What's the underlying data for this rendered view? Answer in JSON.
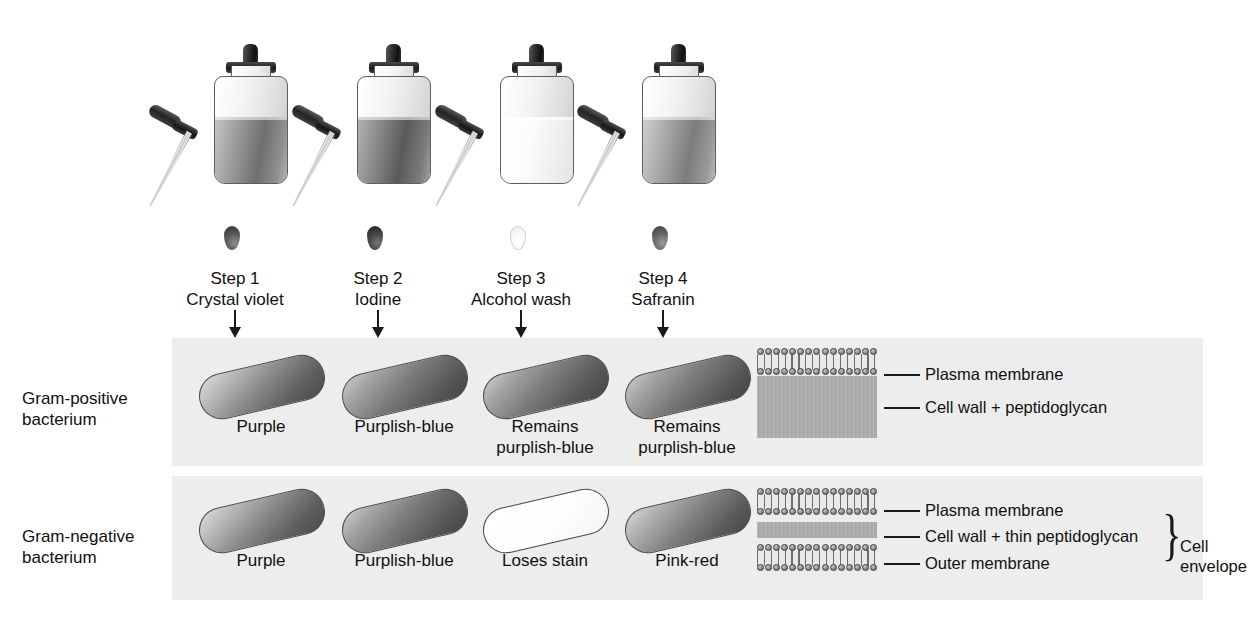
{
  "figure": {
    "background_color": "#ffffff",
    "band_color": "#ededed",
    "peptidoglycan_color": "#a9a9a9",
    "ink_color": "#111111"
  },
  "steps": [
    {
      "index": 1,
      "step_label": "Step 1",
      "reagent": "Crystal violet",
      "bottle_fill": "dark",
      "droplet_fill": "dark",
      "left": 140
    },
    {
      "index": 2,
      "step_label": "Step 2",
      "reagent": "Iodine",
      "bottle_fill": "darker",
      "droplet_fill": "darker",
      "left": 283
    },
    {
      "index": 3,
      "step_label": "Step 3",
      "reagent": "Alcohol wash",
      "bottle_fill": "pale",
      "droplet_fill": "pale",
      "left": 426
    },
    {
      "index": 4,
      "step_label": "Step 4",
      "reagent": "Safranin",
      "bottle_fill": "mid",
      "droplet_fill": "mid",
      "left": 568
    }
  ],
  "rows": [
    {
      "id": "gram-positive",
      "label_line1": "Gram-positive",
      "label_line2": "bacterium",
      "results": [
        {
          "caption_line1": "Purple",
          "caption_line2": "",
          "rod_style": "purple",
          "left": 186
        },
        {
          "caption_line1": "Purplish-blue",
          "caption_line2": "",
          "rod_style": "purplish-blue",
          "left": 329
        },
        {
          "caption_line1": "Remains",
          "caption_line2": "purplish-blue",
          "rod_style": "purplish-blue",
          "left": 470
        },
        {
          "caption_line1": "Remains",
          "caption_line2": "purplish-blue",
          "rod_style": "purplish-blue",
          "left": 612
        }
      ],
      "envelope": {
        "layers": [
          {
            "type": "bilayer",
            "label": "Plasma membrane"
          },
          {
            "type": "peptidoglycan",
            "label": "Cell wall + peptidoglycan",
            "thickness": 62
          }
        ],
        "brace_label_line1": "",
        "brace_label_line2": ""
      }
    },
    {
      "id": "gram-negative",
      "label_line1": "Gram-negative",
      "label_line2": "bacterium",
      "results": [
        {
          "caption_line1": "Purple",
          "caption_line2": "",
          "rod_style": "purple",
          "left": 186
        },
        {
          "caption_line1": "Purplish-blue",
          "caption_line2": "",
          "rod_style": "purplish-blue",
          "left": 329
        },
        {
          "caption_line1": "Loses stain",
          "caption_line2": "",
          "rod_style": "white",
          "left": 470
        },
        {
          "caption_line1": "Pink-red",
          "caption_line2": "",
          "rod_style": "pinkred",
          "left": 612
        }
      ],
      "envelope": {
        "layers": [
          {
            "type": "bilayer",
            "label": "Plasma membrane"
          },
          {
            "type": "peptidoglycan",
            "label": "Cell wall + thin peptidoglycan",
            "thickness": 16
          },
          {
            "type": "bilayer",
            "label": "Outer membrane"
          }
        ],
        "brace_label_line1": "Cell",
        "brace_label_line2": "envelope"
      }
    }
  ],
  "envelope_labels": {
    "plasma_membrane": "Plasma membrane",
    "cell_wall_peptidoglycan": "Cell wall + peptidoglycan",
    "cell_wall_thin_peptidoglycan": "Cell wall + thin peptidoglycan",
    "outer_membrane": "Outer membrane",
    "cell_envelope_line1": "Cell",
    "cell_envelope_line2": "envelope"
  }
}
